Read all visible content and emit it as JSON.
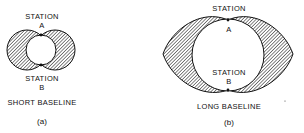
{
  "figure_a": {
    "station_top_label": "STATION",
    "station_top_letter": "A",
    "station_bottom_label": "STATION",
    "station_bottom_letter": "B",
    "baseline_label": "SHORT BASELINE",
    "caption": "(a)"
  },
  "figure_b": {
    "station_top_label": "STATION",
    "station_top_letter": "A",
    "station_bottom_label": "STATION",
    "station_bottom_letter": "B",
    "baseline_label": "LONG BASELINE",
    "caption": "(b)"
  },
  "colors": {
    "ink": "#111111",
    "background": "#ffffff"
  }
}
